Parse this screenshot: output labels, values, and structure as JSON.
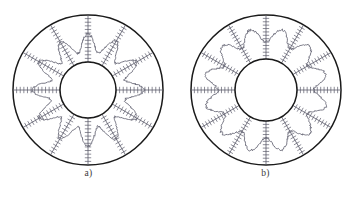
{
  "figure": {
    "background_color": "#ffffff",
    "panels": [
      {
        "id": "panel-a",
        "caption": "a)",
        "center_x": 88,
        "center_y": 90,
        "outer_radius": 75,
        "inner_radius": 28,
        "spoke_count": 12,
        "spoke_inner_radius": 28,
        "spoke_outer_radius": 75,
        "tick_count_per_spoke": 13,
        "tick_half_length": 3.2,
        "contour_mean_radius": 47,
        "contour_amplitude": 9,
        "contour_phase_outward_at_spoke": true,
        "contour_jitter": 1.3,
        "outer_circle_color": "#1a1a1a",
        "outer_circle_width": 1.5,
        "inner_circle_color": "#1a1a1a",
        "inner_circle_width": 1.5,
        "spoke_color": "#5a5a6a",
        "spoke_width": 0.8,
        "tick_color": "#5a5a6a",
        "tick_width": 0.7,
        "contour_color": "#6a6a78",
        "contour_width": 0.9
      },
      {
        "id": "panel-b",
        "caption": "b)",
        "center_x": 89,
        "center_y": 90,
        "outer_radius": 75,
        "inner_radius": 31,
        "spoke_count": 12,
        "spoke_inner_radius": 31,
        "spoke_outer_radius": 75,
        "tick_count_per_spoke": 13,
        "tick_half_length": 3.2,
        "contour_mean_radius": 55,
        "contour_amplitude": 7,
        "contour_phase_outward_at_spoke": false,
        "contour_jitter": 1.3,
        "outer_circle_color": "#1a1a1a",
        "outer_circle_width": 1.5,
        "inner_circle_color": "#1a1a1a",
        "inner_circle_width": 1.5,
        "spoke_color": "#5a5a6a",
        "spoke_width": 0.8,
        "tick_color": "#5a5a6a",
        "tick_width": 0.7,
        "contour_color": "#6a6a78",
        "contour_width": 0.9
      }
    ]
  }
}
